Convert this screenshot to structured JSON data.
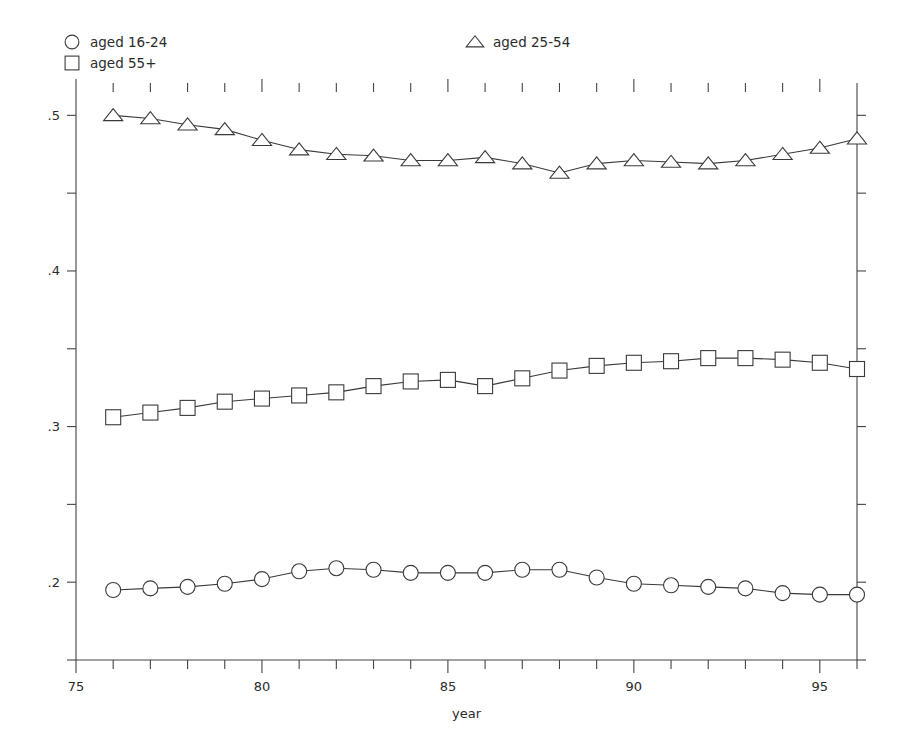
{
  "chart_data": {
    "type": "line",
    "title": "",
    "subtitle": "",
    "xlabel": "year",
    "ylabel": "",
    "xlim": [
      75,
      96
    ],
    "ylim": [
      0.15,
      0.515
    ],
    "grid": false,
    "legend_position": "top",
    "x_ticks_major": [
      75,
      80,
      85,
      90,
      95
    ],
    "x_ticks_minor": [
      76,
      77,
      78,
      79,
      81,
      82,
      83,
      84,
      86,
      87,
      88,
      89,
      91,
      92,
      93,
      94,
      96
    ],
    "x_tick_labels": [
      "75",
      "80",
      "85",
      "90",
      "95"
    ],
    "y_ticks_major": [
      0.2,
      0.3,
      0.4,
      0.5
    ],
    "y_ticks_minor": [
      0.15,
      0.25,
      0.35,
      0.45
    ],
    "y_tick_labels": [
      ".2",
      ".3",
      ".4",
      ".5"
    ],
    "x": [
      76,
      77,
      78,
      79,
      80,
      81,
      82,
      83,
      84,
      85,
      86,
      87,
      88,
      89,
      90,
      91,
      92,
      93,
      94,
      95,
      96
    ],
    "series": [
      {
        "name": "aged 16-24",
        "marker": "circle",
        "values": [
          0.195,
          0.196,
          0.197,
          0.199,
          0.202,
          0.207,
          0.209,
          0.208,
          0.206,
          0.206,
          0.206,
          0.208,
          0.208,
          0.203,
          0.199,
          0.198,
          0.197,
          0.196,
          0.193,
          0.192,
          0.192
        ]
      },
      {
        "name": "aged 25-54",
        "marker": "triangle",
        "values": [
          0.5,
          0.498,
          0.494,
          0.491,
          0.484,
          0.478,
          0.475,
          0.474,
          0.471,
          0.471,
          0.473,
          0.469,
          0.463,
          0.469,
          0.471,
          0.47,
          0.469,
          0.471,
          0.475,
          0.479,
          0.485
        ]
      },
      {
        "name": "aged 55+",
        "marker": "square",
        "values": [
          0.306,
          0.309,
          0.312,
          0.316,
          0.318,
          0.32,
          0.322,
          0.326,
          0.329,
          0.33,
          0.326,
          0.331,
          0.336,
          0.339,
          0.341,
          0.342,
          0.344,
          0.344,
          0.343,
          0.341,
          0.337
        ]
      }
    ],
    "legend": [
      {
        "label": "aged 16-24",
        "marker": "circle"
      },
      {
        "label": "aged 55+",
        "marker": "square"
      },
      {
        "label": "aged 25-54",
        "marker": "triangle"
      }
    ],
    "colors": {
      "line": "#3a3a3a",
      "axis": "#444444",
      "text": "#2b2b2b",
      "marker_fill": "#ffffff",
      "background": "#ffffff"
    }
  }
}
